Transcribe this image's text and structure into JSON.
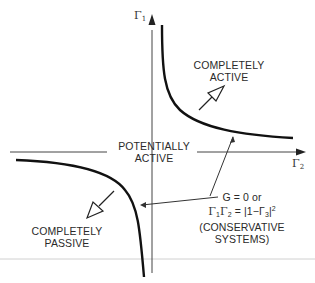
{
  "diagram": {
    "axes": {
      "y_label": "Γ",
      "y_label_sub": "1",
      "x_label": "Γ",
      "x_label_sub": "2"
    },
    "regions": {
      "completely_active": [
        "COMPLETELY",
        "ACTIVE"
      ],
      "potentially_active": [
        "POTENTIALLY",
        "ACTIVE"
      ],
      "completely_passive": [
        "COMPLETELY",
        "PASSIVE"
      ]
    },
    "annotation": {
      "line1": "G = 0 or",
      "line2_parts": [
        "Γ",
        "1",
        "Γ",
        "2",
        " = |1−Γ",
        "3",
        "|",
        "2"
      ],
      "line3": "(CONSERVATIVE",
      "line4": "SYSTEMS)"
    },
    "colors": {
      "ink": "#1a1a1a",
      "axis": "#444444",
      "rule": "#cccccc",
      "background": "#ffffff"
    }
  }
}
